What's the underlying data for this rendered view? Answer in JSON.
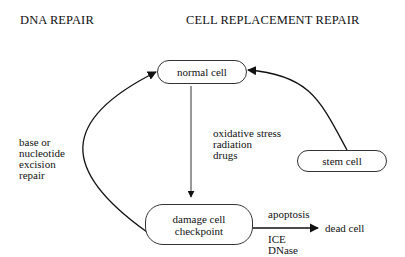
{
  "headings": {
    "left": "DNA REPAIR",
    "right": "CELL REPLACEMENT REPAIR"
  },
  "nodes": {
    "normal_cell": "normal cell",
    "stem_cell": "stem cell",
    "damage_cell": [
      "damage cell",
      "checkpoint"
    ],
    "dead_cell": "dead cell"
  },
  "edges": {
    "damage_to_normal": {
      "label": [
        "base or",
        "nucleotide",
        "excision",
        "repair"
      ]
    },
    "normal_to_damage": {
      "label": [
        "oxidative stress",
        "radiation",
        "drugs"
      ]
    },
    "stem_to_normal": {
      "label": []
    },
    "damage_to_dead": {
      "label_above": "apoptosis",
      "label_below": [
        "ICE",
        "DNase"
      ]
    }
  }
}
